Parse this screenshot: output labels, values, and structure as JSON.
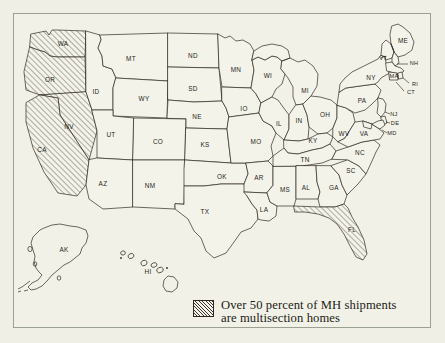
{
  "figure": {
    "type": "choropleth-map",
    "region": "United States",
    "background_color": "#efefe6",
    "frame_color": "#9aa193",
    "ink_color": "#241f19",
    "hatch_fill_color": "#3a342b",
    "plain_fill_color": "#f4f3ea"
  },
  "legend": {
    "swatch_pattern": "diagonal-hatch",
    "text": "Over 50 percent of MH shipments\nare multisection homes",
    "line1": "Over 50 percent of MH shipments",
    "line2": "are multisection homes"
  },
  "map": {
    "highlighted_states": [
      "WA",
      "OR",
      "NV",
      "CA",
      "FL"
    ],
    "highlight_meaning": "Over 50 percent of MH shipments are multisection homes",
    "states": [
      {
        "code": "WA",
        "hatched": true,
        "label_x": 63,
        "label_y": 44
      },
      {
        "code": "OR",
        "hatched": true,
        "label_x": 50,
        "label_y": 80
      },
      {
        "code": "CA",
        "hatched": true,
        "label_x": 42,
        "label_y": 150
      },
      {
        "code": "NV",
        "hatched": true,
        "label_x": 69,
        "label_y": 127
      },
      {
        "code": "ID",
        "hatched": false,
        "label_x": 96,
        "label_y": 92
      },
      {
        "code": "MT",
        "hatched": false,
        "label_x": 131,
        "label_y": 59
      },
      {
        "code": "WY",
        "hatched": false,
        "label_x": 144,
        "label_y": 99
      },
      {
        "code": "UT",
        "hatched": false,
        "label_x": 111,
        "label_y": 135
      },
      {
        "code": "AZ",
        "hatched": false,
        "label_x": 103,
        "label_y": 184
      },
      {
        "code": "CO",
        "hatched": false,
        "label_x": 158,
        "label_y": 142
      },
      {
        "code": "NM",
        "hatched": false,
        "label_x": 150,
        "label_y": 186
      },
      {
        "code": "ND",
        "hatched": false,
        "label_x": 193,
        "label_y": 56
      },
      {
        "code": "SD",
        "hatched": false,
        "label_x": 193,
        "label_y": 89
      },
      {
        "code": "NE",
        "hatched": false,
        "label_x": 197,
        "label_y": 117
      },
      {
        "code": "KS",
        "hatched": false,
        "label_x": 205,
        "label_y": 145
      },
      {
        "code": "OK",
        "hatched": false,
        "label_x": 222,
        "label_y": 177
      },
      {
        "code": "TX",
        "hatched": false,
        "label_x": 205,
        "label_y": 212
      },
      {
        "code": "MN",
        "hatched": false,
        "label_x": 236,
        "label_y": 70
      },
      {
        "code": "IO",
        "hatched": false,
        "label_x": 244,
        "label_y": 109
      },
      {
        "code": "MO",
        "hatched": false,
        "label_x": 256,
        "label_y": 142
      },
      {
        "code": "AR",
        "hatched": false,
        "label_x": 259,
        "label_y": 178
      },
      {
        "code": "LA",
        "hatched": false,
        "label_x": 264,
        "label_y": 210
      },
      {
        "code": "WI",
        "hatched": false,
        "label_x": 268,
        "label_y": 76
      },
      {
        "code": "IL",
        "hatched": false,
        "label_x": 279,
        "label_y": 124
      },
      {
        "code": "MS",
        "hatched": false,
        "label_x": 285,
        "label_y": 190
      },
      {
        "code": "MI",
        "hatched": false,
        "label_x": 305,
        "label_y": 91
      },
      {
        "code": "IN",
        "hatched": false,
        "label_x": 299,
        "label_y": 121
      },
      {
        "code": "KY",
        "hatched": false,
        "label_x": 313,
        "label_y": 141
      },
      {
        "code": "TN",
        "hatched": false,
        "label_x": 305,
        "label_y": 160
      },
      {
        "code": "AL",
        "hatched": false,
        "label_x": 306,
        "label_y": 188
      },
      {
        "code": "OH",
        "hatched": false,
        "label_x": 325,
        "label_y": 115
      },
      {
        "code": "GA",
        "hatched": false,
        "label_x": 334,
        "label_y": 188
      },
      {
        "code": "SC",
        "hatched": false,
        "label_x": 351,
        "label_y": 171
      },
      {
        "code": "NC",
        "hatched": false,
        "label_x": 360,
        "label_y": 153
      },
      {
        "code": "WV",
        "hatched": false,
        "label_x": 344,
        "label_y": 134
      },
      {
        "code": "VA",
        "hatched": false,
        "label_x": 364,
        "label_y": 134
      },
      {
        "code": "PA",
        "hatched": false,
        "label_x": 362,
        "label_y": 101
      },
      {
        "code": "NY",
        "hatched": false,
        "label_x": 371,
        "label_y": 78
      },
      {
        "code": "ME",
        "hatched": false,
        "label_x": 403,
        "label_y": 41
      },
      {
        "code": "VT",
        "hatched": false,
        "label_x": 383,
        "label_y": 59
      },
      {
        "code": "NH",
        "hatched": false,
        "label_x": 414,
        "label_y": 64
      },
      {
        "code": "MA",
        "hatched": false,
        "label_x": 394,
        "label_y": 77
      },
      {
        "code": "RI",
        "hatched": false,
        "label_x": 415,
        "label_y": 85
      },
      {
        "code": "CT",
        "hatched": false,
        "label_x": 411,
        "label_y": 93
      },
      {
        "code": "NJ",
        "hatched": false,
        "label_x": 394,
        "label_y": 115
      },
      {
        "code": "DE",
        "hatched": false,
        "label_x": 395,
        "label_y": 124
      },
      {
        "code": "MD",
        "hatched": false,
        "label_x": 392,
        "label_y": 134
      },
      {
        "code": "FL",
        "hatched": true,
        "label_x": 352,
        "label_y": 230
      },
      {
        "code": "AK",
        "hatched": false,
        "label_x": 64,
        "label_y": 250
      },
      {
        "code": "HI",
        "hatched": false,
        "label_x": 148,
        "label_y": 272
      }
    ]
  }
}
